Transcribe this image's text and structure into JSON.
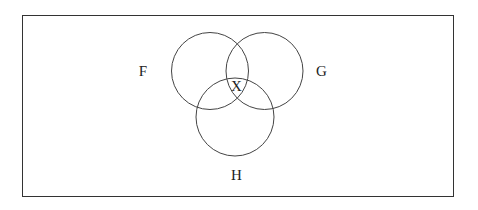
{
  "diagram": {
    "type": "venn",
    "sets": [
      {
        "name": "F",
        "label": "F",
        "cx": 210,
        "cy": 71,
        "r": 38.5,
        "label_x": 143,
        "label_y": 76
      },
      {
        "name": "G",
        "label": "G",
        "cx": 264.5,
        "cy": 71,
        "r": 38.5,
        "label_x": 321,
        "label_y": 76
      },
      {
        "name": "H",
        "label": "H",
        "cx": 235,
        "cy": 117,
        "r": 39,
        "label_x": 236.5,
        "label_y": 180
      }
    ],
    "regions": [
      {
        "label": "X",
        "location": "F ∩ G ∩ H",
        "x": 236.5,
        "y": 91
      }
    ],
    "colors": {
      "stroke": "#444444",
      "border": "#333333",
      "text": "#222222",
      "background": "#ffffff"
    }
  }
}
